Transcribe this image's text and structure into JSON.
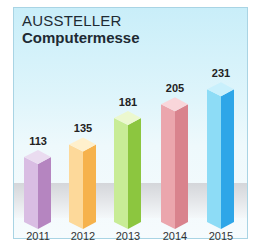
{
  "header": {
    "line1": "AUSSTELLER",
    "line2": "Computermesse"
  },
  "chart_data": {
    "type": "bar",
    "title": "AUSSTELLER Computermesse",
    "xlabel": "",
    "ylabel": "",
    "categories": [
      "2011",
      "2012",
      "2013",
      "2014",
      "2015"
    ],
    "values": [
      113,
      135,
      181,
      205,
      231
    ],
    "colors": [
      {
        "front": "#d9bde3",
        "side": "#b585c0",
        "top": "#eadcf0"
      },
      {
        "front": "#fdd99a",
        "side": "#f6b24c",
        "top": "#fff0cc"
      },
      {
        "front": "#c8ec96",
        "side": "#8cc63f",
        "top": "#ecf8cf"
      },
      {
        "front": "#eba6ad",
        "side": "#d9838d",
        "top": "#f9d6da"
      },
      {
        "front": "#8ddcf6",
        "side": "#2ea6e8",
        "top": "#c9f0fc"
      }
    ],
    "grid": false,
    "legend": "none",
    "bar_style": "3d-isometric"
  }
}
